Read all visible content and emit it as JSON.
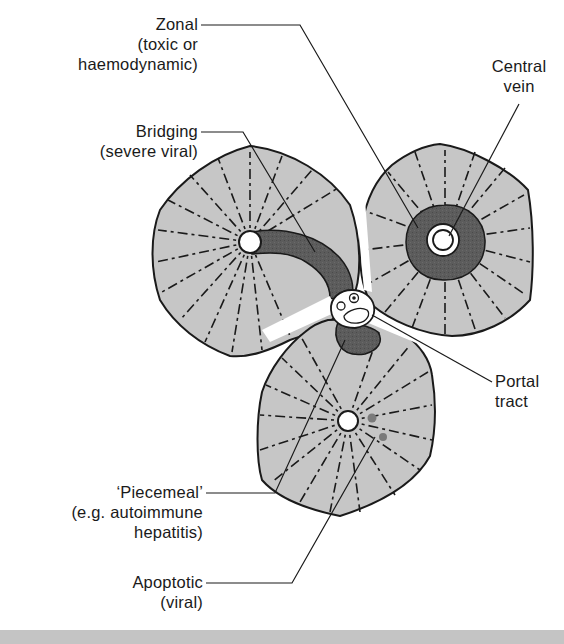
{
  "figure": {
    "colors": {
      "lobule_fill": "#c6c6c6",
      "necrosis_fill": "#5a5a5a",
      "outline": "#1a1a1a",
      "background": "#ffffff",
      "apoptotic_body": "#7a7a7a",
      "bottom_strip": "#c4c4c4"
    }
  },
  "labels": {
    "zonal": {
      "line1": "Zonal",
      "line2": "(toxic or",
      "line3": "haemodynamic)"
    },
    "central_vein": {
      "line1": "Central",
      "line2": "vein"
    },
    "bridging": {
      "line1": "Bridging",
      "line2": "(severe viral)"
    },
    "portal_tract": {
      "line1": "Portal",
      "line2": "tract"
    },
    "piecemeal": {
      "line1": "‘Piecemeal’",
      "line2": "(e.g. autoimmune",
      "line3": "hepatitis)"
    },
    "apoptotic": {
      "line1": "Apoptotic",
      "line2": "(viral)"
    }
  }
}
